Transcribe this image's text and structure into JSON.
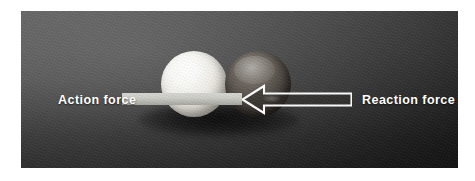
{
  "figure": {
    "plate": {
      "background_color": "#4a4a4a",
      "border_color": "#ffffff"
    }
  },
  "labels": {
    "action": "Action force",
    "reaction": "Reaction force",
    "text_color": "#ffffff"
  },
  "arrows": {
    "action": {
      "name": "action-force-arrow",
      "direction": "right",
      "style": "solid-bar",
      "color": "#d0d0cb"
    },
    "reaction": {
      "name": "reaction-force-arrow",
      "direction": "left",
      "style": "outlined-hollow",
      "outline_color": "#ffffff",
      "fill_color": "#2e2b28"
    }
  },
  "objects": [
    {
      "name": "white-ball",
      "label": "White ball",
      "color": "#f2f0ea"
    },
    {
      "name": "dark-ball",
      "label": "Dark ball",
      "color": "#4c463f"
    }
  ]
}
